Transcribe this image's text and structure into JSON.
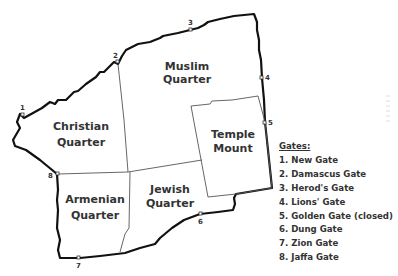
{
  "map": {
    "quarters": [
      {
        "name": "Muslim",
        "line1": "Muslim",
        "line2": "Quarter"
      },
      {
        "name": "Christian",
        "line1": "Christian",
        "line2": "Quarter"
      },
      {
        "name": "Temple Mount",
        "line1": "Temple",
        "line2": "Mount"
      },
      {
        "name": "Armenian",
        "line1": "Armenian",
        "line2": "Quarter"
      },
      {
        "name": "Jewish",
        "line1": "Jewish",
        "line2": "Quarter"
      }
    ],
    "gate_markers": [
      "1",
      "2",
      "3",
      "4",
      "5",
      "6",
      "7",
      "8"
    ]
  },
  "legend": {
    "title": "Gates:",
    "items": [
      "1. New Gate",
      "2. Damascus Gate",
      "3. Herod's Gate",
      "4. Lions' Gate",
      "5. Golden Gate (closed)",
      "6. Dung Gate",
      "7. Zion Gate",
      "8. Jaffa Gate"
    ]
  }
}
